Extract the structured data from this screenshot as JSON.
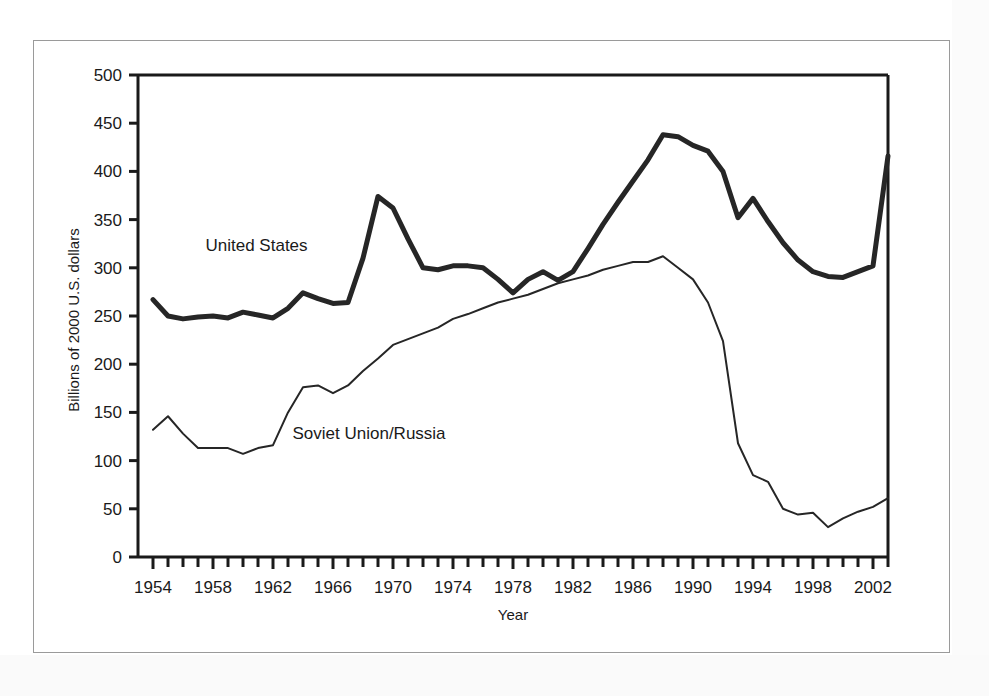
{
  "figure": {
    "background_color": "#ffffff",
    "border_color": "#9a9a9a"
  },
  "chart_data": {
    "type": "line",
    "title": "",
    "xlabel": "Year",
    "ylabel": "Billions of 2000 U.S. dollars",
    "xlim": [
      1953,
      2003
    ],
    "ylim": [
      0,
      500
    ],
    "ytick_step": 50,
    "xtick_step": 1,
    "xlabel_step": 4,
    "grid": false,
    "legend_position": "inline-annotation",
    "yticks": [
      0,
      50,
      100,
      150,
      200,
      250,
      300,
      350,
      400,
      450,
      500
    ],
    "ytick_labels": [
      "0",
      "50",
      "100",
      "150",
      "200",
      "250",
      "300",
      "350",
      "400",
      "450",
      "500"
    ],
    "xticks": [
      1954,
      1955,
      1956,
      1957,
      1958,
      1959,
      1960,
      1961,
      1962,
      1963,
      1964,
      1965,
      1966,
      1967,
      1968,
      1969,
      1970,
      1971,
      1972,
      1973,
      1974,
      1975,
      1976,
      1977,
      1978,
      1979,
      1980,
      1981,
      1982,
      1983,
      1984,
      1985,
      1986,
      1987,
      1988,
      1989,
      1990,
      1991,
      1992,
      1993,
      1994,
      1995,
      1996,
      1997,
      1998,
      1999,
      2000,
      2001,
      2002,
      2003
    ],
    "xtick_labels": [
      "1954",
      "1958",
      "1962",
      "1966",
      "1970",
      "1974",
      "1978",
      "1982",
      "1986",
      "1990",
      "1994",
      "1998",
      "2002"
    ],
    "x": [
      1954,
      1955,
      1956,
      1957,
      1958,
      1959,
      1960,
      1961,
      1962,
      1963,
      1964,
      1965,
      1966,
      1967,
      1968,
      1969,
      1970,
      1971,
      1972,
      1973,
      1974,
      1975,
      1976,
      1977,
      1978,
      1979,
      1980,
      1981,
      1982,
      1983,
      1984,
      1985,
      1986,
      1987,
      1988,
      1989,
      1990,
      1991,
      1992,
      1993,
      1994,
      1995,
      1996,
      1997,
      1998,
      1999,
      2000,
      2001,
      2002,
      2003
    ],
    "series": [
      {
        "name": "United States",
        "label": "United States",
        "color": "#262626",
        "line_width": 5,
        "label_x": 1957.5,
        "label_y": 317,
        "values": [
          267,
          250,
          247,
          249,
          250,
          248,
          254,
          251,
          248,
          258,
          274,
          268,
          263,
          264,
          310,
          374,
          362,
          330,
          300,
          298,
          302,
          302,
          300,
          288,
          274,
          288,
          296,
          287,
          296,
          320,
          345,
          368,
          390,
          412,
          438,
          436,
          427,
          421,
          400,
          352,
          372,
          348,
          326,
          308,
          296,
          291,
          290,
          296,
          302,
          416
        ]
      },
      {
        "name": "Soviet Union/Russia",
        "label": "Soviet Union/Russia",
        "color": "#262626",
        "line_width": 2,
        "label_x": 1963.3,
        "label_y": 122,
        "values": [
          132,
          146,
          128,
          113,
          113,
          113,
          107,
          113,
          116,
          150,
          176,
          178,
          170,
          178,
          193,
          206,
          220,
          226,
          232,
          238,
          247,
          252,
          258,
          264,
          268,
          272,
          278,
          284,
          288,
          292,
          298,
          302,
          306,
          306,
          312,
          300,
          288,
          264,
          224,
          118,
          85,
          78,
          50,
          44,
          46,
          31,
          40,
          47,
          52,
          61
        ]
      }
    ]
  },
  "axes": {
    "y_axis_title": "Billions of 2000 U.S. dollars",
    "x_axis_title": "Year"
  }
}
